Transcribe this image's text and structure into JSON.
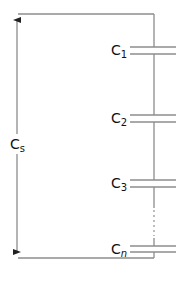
{
  "diagram": {
    "title": "",
    "type": "series capacitor circuit",
    "total_label": {
      "main": "C",
      "sub": "s"
    },
    "capacitors": [
      {
        "main": "C",
        "sub": "1",
        "y": 50
      },
      {
        "main": "C",
        "sub": "2",
        "y": 118
      },
      {
        "main": "C",
        "sub": "3",
        "y": 183
      },
      {
        "main": "C",
        "sub": "n",
        "y": 249
      }
    ],
    "ellipsis": "⋮",
    "colors": {
      "wire": "#8c8c8c",
      "label": "#111111"
    }
  }
}
